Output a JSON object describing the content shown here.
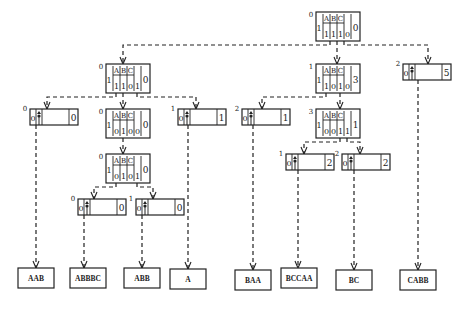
{
  "diagram": {
    "type": "trie-tree",
    "alphabet": [
      "A",
      "B",
      "C"
    ],
    "internal_nodes": [
      {
        "id": "root",
        "level": "0",
        "flag": "1",
        "bits": [
          "1",
          "1",
          "1",
          "0"
        ],
        "count": "0",
        "x": 316,
        "y": 12
      },
      {
        "id": "n1",
        "level": "0",
        "flag": "1",
        "bits": [
          "1",
          "1",
          "0",
          "1"
        ],
        "count": "0",
        "x": 106,
        "y": 64
      },
      {
        "id": "n2",
        "level": "1",
        "flag": "1",
        "bits": [
          "1",
          "0",
          "1",
          "0"
        ],
        "count": "3",
        "x": 316,
        "y": 64
      },
      {
        "id": "n4",
        "level": "0",
        "flag": "1",
        "bits": [
          "0",
          "1",
          "0",
          "0"
        ],
        "count": "0",
        "x": 106,
        "y": 109
      },
      {
        "id": "n8",
        "level": "3",
        "flag": "1",
        "bits": [
          "0",
          "0",
          "1",
          "1"
        ],
        "count": "1",
        "x": 316,
        "y": 109
      },
      {
        "id": "n5",
        "level": "0",
        "flag": "1",
        "bits": [
          "0",
          "1",
          "0",
          "1"
        ],
        "count": "0",
        "x": 106,
        "y": 154
      }
    ],
    "pointer_nodes": [
      {
        "id": "p3",
        "level": "2",
        "flag": "0",
        "count": "5",
        "x": 403,
        "y": 64
      },
      {
        "id": "pAAB",
        "level": "0",
        "flag": "0",
        "count": "0",
        "x": 30,
        "y": 109
      },
      {
        "id": "pA",
        "level": "1",
        "flag": "0",
        "count": "1",
        "x": 178,
        "y": 109
      },
      {
        "id": "pBAA",
        "level": "2",
        "flag": "0",
        "count": "1",
        "x": 242,
        "y": 109
      },
      {
        "id": "pABBBC",
        "level": "0",
        "flag": "0",
        "count": "0",
        "x": 78,
        "y": 199
      },
      {
        "id": "pABB",
        "level": "1",
        "flag": "0",
        "count": "0",
        "x": 136,
        "y": 199
      },
      {
        "id": "pBCCAA",
        "level": "1",
        "flag": "0",
        "count": "2",
        "x": 286,
        "y": 154
      },
      {
        "id": "pBC",
        "level": "2",
        "flag": "0",
        "count": "2",
        "x": 342,
        "y": 154
      }
    ],
    "leaves": [
      {
        "id": "lAAB",
        "label": "AAB",
        "x": 18,
        "y": 268,
        "w": 36
      },
      {
        "id": "lABBBC",
        "label": "ABBBC",
        "x": 70,
        "y": 268,
        "w": 36
      },
      {
        "id": "lABB",
        "label": "ABB",
        "x": 124,
        "y": 268,
        "w": 36
      },
      {
        "id": "lA",
        "label": "A",
        "x": 170,
        "y": 269,
        "w": 36
      },
      {
        "id": "lBAA",
        "label": "BAA",
        "x": 235,
        "y": 270,
        "w": 36
      },
      {
        "id": "lBCCAA",
        "label": "BCCAA",
        "x": 281,
        "y": 268,
        "w": 36
      },
      {
        "id": "lBC",
        "label": "BC",
        "x": 336,
        "y": 270,
        "w": 36
      },
      {
        "id": "lCABB",
        "label": "CABB",
        "x": 400,
        "y": 270,
        "w": 36
      }
    ],
    "edges": [
      {
        "from": "root",
        "to": "n1",
        "pts": [
          [
            330,
            41
          ],
          [
            330,
            45
          ],
          [
            123,
            45
          ],
          [
            123,
            64
          ]
        ]
      },
      {
        "from": "root",
        "to": "n2",
        "pts": [
          [
            337,
            41
          ],
          [
            337,
            64
          ]
        ]
      },
      {
        "from": "root",
        "to": "p3",
        "pts": [
          [
            344,
            41
          ],
          [
            344,
            45
          ],
          [
            428,
            45
          ],
          [
            428,
            64
          ]
        ]
      },
      {
        "from": "n1",
        "to": "pAAB",
        "pts": [
          [
            116,
            93
          ],
          [
            116,
            97
          ],
          [
            47,
            97
          ],
          [
            47,
            109
          ]
        ]
      },
      {
        "from": "n1",
        "to": "n4",
        "pts": [
          [
            123,
            93
          ],
          [
            123,
            109
          ]
        ]
      },
      {
        "from": "n1",
        "to": "pA",
        "pts": [
          [
            137,
            93
          ],
          [
            137,
            97
          ],
          [
            196,
            97
          ],
          [
            196,
            109
          ]
        ]
      },
      {
        "from": "n2",
        "to": "pBAA",
        "pts": [
          [
            326,
            93
          ],
          [
            326,
            97
          ],
          [
            262,
            97
          ],
          [
            262,
            109
          ]
        ]
      },
      {
        "from": "n2",
        "to": "n8",
        "pts": [
          [
            340,
            93
          ],
          [
            340,
            109
          ]
        ]
      },
      {
        "from": "n4",
        "to": "n5",
        "pts": [
          [
            123,
            138
          ],
          [
            123,
            154
          ]
        ]
      },
      {
        "from": "n5",
        "to": "pABBBC",
        "pts": [
          [
            116,
            183
          ],
          [
            116,
            187
          ],
          [
            94,
            187
          ],
          [
            94,
            199
          ]
        ]
      },
      {
        "from": "n5",
        "to": "pABB",
        "pts": [
          [
            137,
            183
          ],
          [
            137,
            187
          ],
          [
            153,
            187
          ],
          [
            153,
            199
          ]
        ]
      },
      {
        "from": "n8",
        "to": "pBCCAA",
        "pts": [
          [
            340,
            138
          ],
          [
            340,
            142
          ],
          [
            304,
            142
          ],
          [
            304,
            154
          ]
        ]
      },
      {
        "from": "n8",
        "to": "pBC",
        "pts": [
          [
            347,
            138
          ],
          [
            347,
            142
          ],
          [
            360,
            142
          ],
          [
            360,
            154
          ]
        ]
      },
      {
        "from": "pAAB",
        "to": "lAAB",
        "pts": [
          [
            36,
            125
          ],
          [
            36,
            268
          ]
        ]
      },
      {
        "from": "pABBBC",
        "to": "lABBBC",
        "pts": [
          [
            84,
            215
          ],
          [
            84,
            268
          ]
        ]
      },
      {
        "from": "pABB",
        "to": "lABB",
        "pts": [
          [
            142,
            215
          ],
          [
            142,
            268
          ]
        ]
      },
      {
        "from": "pA",
        "to": "lA",
        "pts": [
          [
            188,
            125
          ],
          [
            188,
            269
          ]
        ]
      },
      {
        "from": "pBAA",
        "to": "lBAA",
        "pts": [
          [
            253,
            125
          ],
          [
            253,
            270
          ]
        ]
      },
      {
        "from": "pBCCAA",
        "to": "lBCCAA",
        "pts": [
          [
            298,
            170
          ],
          [
            298,
            268
          ]
        ]
      },
      {
        "from": "pBC",
        "to": "lBC",
        "pts": [
          [
            354,
            170
          ],
          [
            354,
            270
          ]
        ]
      },
      {
        "from": "p3",
        "to": "lCABB",
        "pts": [
          [
            418,
            80
          ],
          [
            418,
            270
          ]
        ]
      }
    ]
  }
}
